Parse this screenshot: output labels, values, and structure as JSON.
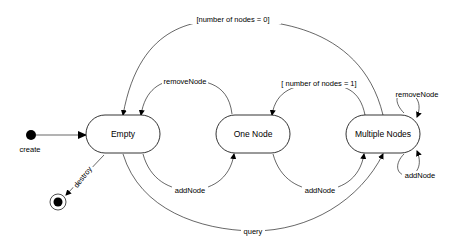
{
  "diagram": {
    "type": "state-machine",
    "states": [
      {
        "id": "empty",
        "label": "Empty"
      },
      {
        "id": "one-node",
        "label": "One Node"
      },
      {
        "id": "multiple-nodes",
        "label": "Multiple Nodes"
      }
    ],
    "pseudo_states": {
      "initial": {
        "label": "create"
      },
      "final": {
        "label": "destroy"
      }
    },
    "transitions": {
      "create": {
        "from": "initial",
        "to": "empty",
        "label": "create"
      },
      "destroy": {
        "from": "empty",
        "to": "final",
        "label": "destroy"
      },
      "empty_to_one": {
        "from": "empty",
        "to": "one-node",
        "label": "addNode"
      },
      "one_to_empty": {
        "from": "one-node",
        "to": "empty",
        "label": "removeNode"
      },
      "one_to_multiple": {
        "from": "one-node",
        "to": "multiple-nodes",
        "label": "addNode"
      },
      "multiple_to_one": {
        "from": "multiple-nodes",
        "to": "one-node",
        "label": "[ number of nodes = 1]"
      },
      "multiple_to_empty": {
        "from": "multiple-nodes",
        "to": "empty",
        "label": "[number of nodes = 0]"
      },
      "multiple_remove_self": {
        "from": "multiple-nodes",
        "to": "multiple-nodes",
        "label": "removeNode"
      },
      "multiple_add_self": {
        "from": "multiple-nodes",
        "to": "multiple-nodes",
        "label": "addNode"
      },
      "empty_query": {
        "from": "empty",
        "to": "multiple-nodes",
        "label": "query"
      }
    }
  }
}
